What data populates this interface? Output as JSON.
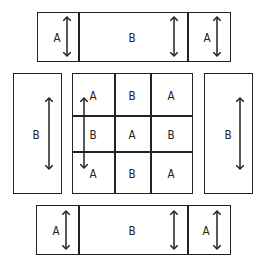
{
  "diagram": {
    "top_strip": {
      "labels": [
        "A",
        "B",
        "A"
      ]
    },
    "left_panel": {
      "label": "B"
    },
    "center_grid": {
      "rows": [
        [
          "A",
          "B",
          "A"
        ],
        [
          "B",
          "A",
          "B"
        ],
        [
          "A",
          "B",
          "A"
        ]
      ]
    },
    "right_panel": {
      "label": "B"
    },
    "bottom_strip": {
      "labels": [
        "A",
        "B",
        "A"
      ]
    }
  },
  "colors": {
    "stroke": "#222222",
    "background": "#ffffff"
  }
}
